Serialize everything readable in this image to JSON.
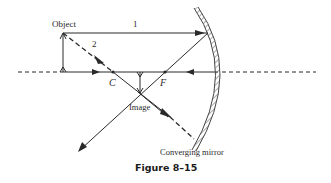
{
  "figure": {
    "caption": "Figure 8–15",
    "labels": {
      "object": "Object",
      "image": "Image",
      "mirror": "Converging mirror",
      "ray1": "1",
      "ray2": "2",
      "center": "C",
      "focus": "F"
    },
    "colors": {
      "line": "#2a2a2a",
      "background": "#ffffff"
    }
  }
}
